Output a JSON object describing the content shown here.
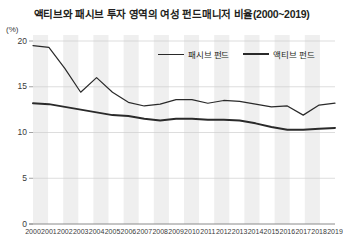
{
  "chart_data": {
    "type": "line",
    "title": "액티브와 패시브 투자 영역의 여성 펀드매니저 비율(2000~2019)",
    "xlabel": "",
    "ylabel": "(%)",
    "ylim": [
      0,
      20
    ],
    "yticks": [
      "0",
      "5",
      "10",
      "15",
      "20"
    ],
    "ytick_values": [
      0,
      5,
      10,
      15,
      20
    ],
    "grid": true,
    "legend_position": "top-right",
    "categories": [
      "2000",
      "2001",
      "2002",
      "2003",
      "2004",
      "2005",
      "2006",
      "2007",
      "2008",
      "2009",
      "2010",
      "2011",
      "2012",
      "2013",
      "2014",
      "2015",
      "2016",
      "2017",
      "2018",
      "2019"
    ],
    "series": [
      {
        "name": "패시브 펀드",
        "style": "thin",
        "color": "#2a2a2a",
        "values": [
          19.5,
          19.3,
          17.0,
          14.4,
          16.0,
          14.4,
          13.3,
          12.9,
          13.1,
          13.6,
          13.6,
          13.2,
          13.5,
          13.4,
          13.1,
          12.8,
          12.9,
          11.9,
          13.0,
          13.2
        ]
      },
      {
        "name": "액티브 펀드",
        "style": "thick",
        "color": "#2a2a2a",
        "values": [
          13.2,
          13.1,
          12.8,
          12.5,
          12.2,
          11.9,
          11.8,
          11.5,
          11.3,
          11.5,
          11.5,
          11.4,
          11.4,
          11.3,
          11.0,
          10.6,
          10.3,
          10.3,
          10.4,
          10.5
        ]
      }
    ]
  },
  "axis": {
    "unit": "(%)"
  }
}
